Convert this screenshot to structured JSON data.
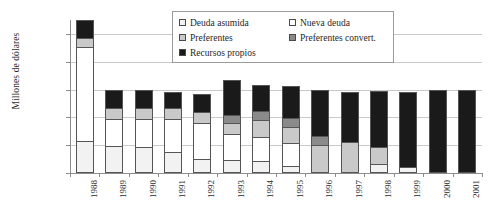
{
  "top_caption": "",
  "chart_data": {
    "type": "bar",
    "subtype": "stacked",
    "title": "",
    "xlabel": "",
    "ylabel": "Millones de dólares",
    "ylim": [
      0,
      27500
    ],
    "yticks": [
      0,
      5000,
      10000,
      15000,
      20000,
      25000
    ],
    "ytick_labels": [
      "0",
      "5.000",
      "10.000",
      "15.000",
      "20.000",
      "25.000"
    ],
    "grid": true,
    "legend_position": "upper center",
    "categories": [
      "1988",
      "1989",
      "1990",
      "1991",
      "1992",
      "1993",
      "1994",
      "1995",
      "1996",
      "1997",
      "1998",
      "1999",
      "2000",
      "2001"
    ],
    "series": [
      {
        "name": "Deuda asumida",
        "color": "#f2f2f2",
        "values": [
          5500,
          4700,
          4600,
          3600,
          2400,
          2200,
          1900,
          900,
          0,
          0,
          1400,
          700,
          0,
          0
        ]
      },
      {
        "name": "Nueva deuda",
        "color": "#ffffff",
        "values": [
          17300,
          5000,
          5200,
          6100,
          6600,
          4700,
          4400,
          4400,
          0,
          0,
          0,
          0,
          0,
          0
        ]
      },
      {
        "name": "Preferentes",
        "color": "#c9c9c9",
        "values": [
          1500,
          1900,
          1900,
          1900,
          2000,
          1900,
          3100,
          2800,
          5000,
          5400,
          2900,
          0,
          0,
          0
        ]
      },
      {
        "name": "Preferentes convert.",
        "color": "#8a8a8a",
        "values": [
          0,
          0,
          0,
          0,
          0,
          1300,
          1500,
          1500,
          1500,
          0,
          0,
          0,
          0,
          0
        ]
      },
      {
        "name": "Recursos propios",
        "color": "#1a1a1a",
        "values": [
          3200,
          3300,
          3200,
          2900,
          3200,
          6600,
          5000,
          6100,
          8400,
          9100,
          10500,
          13900,
          15000,
          14900
        ]
      }
    ]
  },
  "legend": {
    "items": [
      {
        "label": "Deuda asumida",
        "color": "#f2f2f2"
      },
      {
        "label": "Nueva deuda",
        "color": "#ffffff"
      },
      {
        "label": "Preferentes",
        "color": "#c9c9c9"
      },
      {
        "label": "Preferentes convert.",
        "color": "#8a8a8a"
      },
      {
        "label": "Recursos propios",
        "color": "#1a1a1a"
      }
    ]
  }
}
